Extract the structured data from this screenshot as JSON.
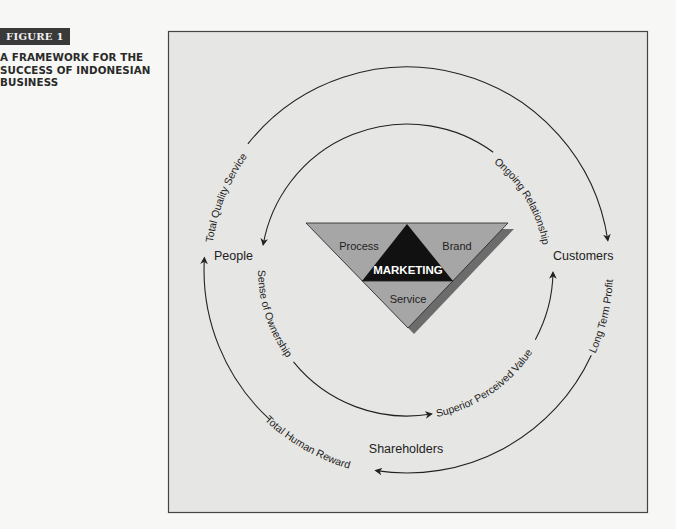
{
  "figure": {
    "label": "FIGURE 1",
    "title_lines": [
      "A FRAMEWORK FOR THE",
      "SUCCESS OF INDONESIAN",
      "BUSINESS"
    ]
  },
  "colors": {
    "panel_bg": "#e6e6e4",
    "panel_border": "#444444",
    "triangle_fill": "#a6a6a6",
    "triangle_shadow": "#6c6c6c",
    "core_fill": "#111111",
    "line": "#222222"
  },
  "diagram": {
    "core": {
      "center": "MARKETING",
      "left": "Process",
      "right": "Brand",
      "bottom": "Service"
    },
    "nodes": {
      "people": "People",
      "customers": "Customers",
      "shareholders": "Shareholders"
    },
    "outer_flows": {
      "people_to_customers": "Total Quality Service",
      "customers_to_shareholders": "Long Term Profit",
      "shareholders_to_people": "Total Human Reward"
    },
    "inner_flows": {
      "customers_to_people": "Ongoing Relationship",
      "people_to_shareholders": "Sense of Ownership",
      "shareholders_to_customers": "Superior Perceived Value"
    }
  }
}
